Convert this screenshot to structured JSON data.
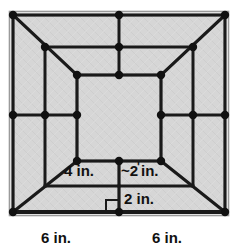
{
  "figure": {
    "type": "geometry-diagram",
    "canvas": {
      "width": 241,
      "height": 250
    },
    "colors": {
      "background": "#ffffff",
      "interior_fill": "#d4d4d4",
      "line": "#1a1a1a",
      "node": "#111111",
      "frame_border": "#8c8c8c",
      "text": "#111111"
    },
    "labels": {
      "inner_left": "4 in.",
      "inner_right_tilde": "~",
      "inner_right_value": "2",
      "inner_right_prime": "'",
      "inner_right_unit": "in.",
      "inner_right_full": "~2' in.",
      "lower_right": "2 in.",
      "base_left": "6 in.",
      "base_right": "6 in."
    },
    "markers": {
      "right_angle": "right-angle-marker"
    },
    "geometry": {
      "outer_square": {
        "x1": 13,
        "y1": 15,
        "x2": 225,
        "y2": 212
      },
      "inner_square": {
        "x1": 77,
        "y1": 75,
        "x2": 161,
        "y2": 161
      },
      "top_mid_node_x": 119,
      "mid_row_y": 115,
      "label_row_y": 176,
      "lower_row_y": 186
    }
  }
}
